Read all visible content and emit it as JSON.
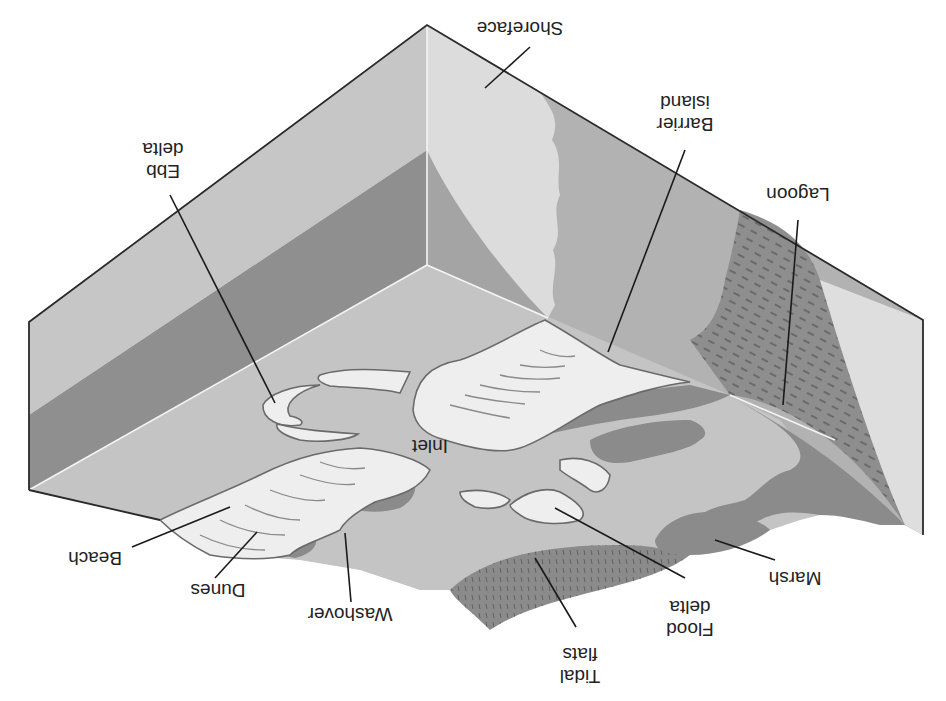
{
  "figure": {
    "orientation": "upside-down",
    "labels": [
      {
        "id": "shoreface",
        "text": "Shoreface"
      },
      {
        "id": "barrier-island",
        "lines": [
          "Barrier",
          "island"
        ]
      },
      {
        "id": "lagoon",
        "text": "Lagoon"
      },
      {
        "id": "ebb-delta",
        "lines": [
          "Ebb",
          "delta"
        ]
      },
      {
        "id": "inlet",
        "text": "Inlet"
      },
      {
        "id": "beach",
        "text": "Beach"
      },
      {
        "id": "dunes",
        "text": "Dunes"
      },
      {
        "id": "washover",
        "text": "Washover"
      },
      {
        "id": "tidal-flats",
        "lines": [
          "Tidal",
          "flats"
        ]
      },
      {
        "id": "flood-delta",
        "lines": [
          "Flood",
          "delta"
        ]
      },
      {
        "id": "marsh",
        "text": "Marsh"
      }
    ]
  },
  "colors": {
    "background": "#ffffff",
    "face_light": "#c9c9c9",
    "face_mid": "#b4b4b4",
    "face_dark": "#8e8e8e",
    "shoreface_sand": "#dedede",
    "sea_floor": "#c4c4c4",
    "sand_body": "#efefef",
    "marsh": "#8b8b8b",
    "lagoon_mud": "#9a9a9a",
    "edge": "#2a2a2a"
  }
}
